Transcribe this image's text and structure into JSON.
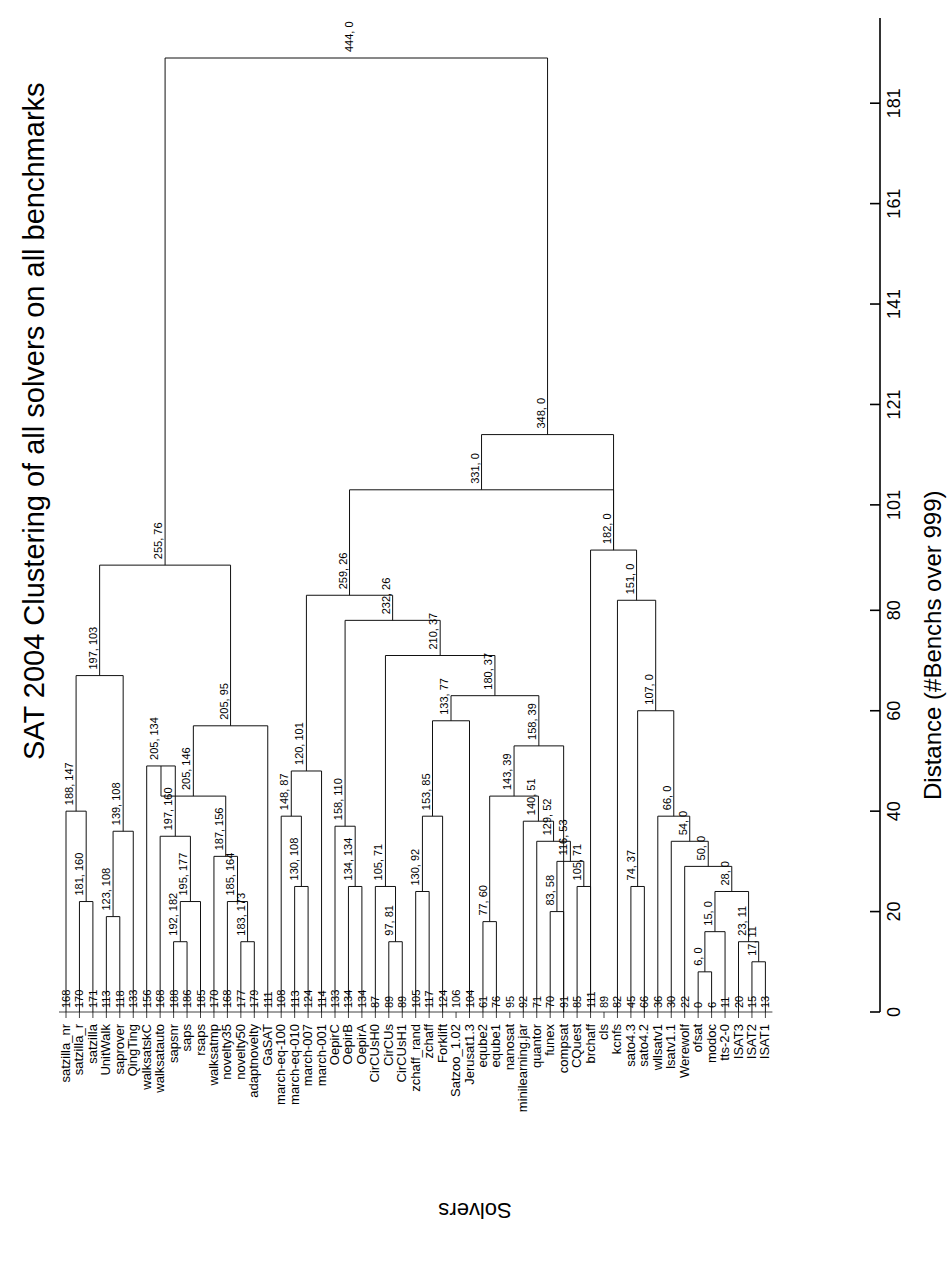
{
  "figure": {
    "title": "SAT 2004 Clustering of all solvers on all benchmarks",
    "y_axis_label": "Solvers",
    "x_axis_label": "Distance (#Benchs over 999)",
    "caption": "Fig. 5. Clusters of all solvers on all benchmarks",
    "orientation": "rotated-90",
    "line_color": "#000000",
    "background_color": "#ffffff"
  },
  "chart_data": {
    "type": "dendrogram",
    "title": "SAT 2004 Clustering of all solvers on all benchmarks",
    "xlabel": "Distance (#Benchs over 999)",
    "ylabel": "Solvers",
    "xlim": [
      0,
      190
    ],
    "grid": false,
    "axis_ticks": [
      0,
      20,
      40,
      60,
      80,
      101,
      121,
      141,
      161,
      181
    ],
    "leaf_count": 56,
    "leaves": [
      {
        "label": "satzilla_nr",
        "value": "168"
      },
      {
        "label": "satzilla_r",
        "value": "170"
      },
      {
        "label": "satzilla",
        "value": "171"
      },
      {
        "label": "UnitWalk",
        "value": "113"
      },
      {
        "label": "saprover",
        "value": "118"
      },
      {
        "label": "QingTing",
        "value": "133"
      },
      {
        "label": "walksatskC",
        "value": "156"
      },
      {
        "label": "walksatauto",
        "value": "168"
      },
      {
        "label": "sapsnr",
        "value": "188"
      },
      {
        "label": "saps",
        "value": "186"
      },
      {
        "label": "rsaps",
        "value": "185"
      },
      {
        "label": "walksatmp",
        "value": "170"
      },
      {
        "label": "novelty35",
        "value": "168"
      },
      {
        "label": "novelty50",
        "value": "177"
      },
      {
        "label": "adaptnovelty",
        "value": "179"
      },
      {
        "label": "GaSAT",
        "value": "111"
      },
      {
        "label": "march-eq-100",
        "value": "108"
      },
      {
        "label": "march-eq-010",
        "value": "113"
      },
      {
        "label": "march-007",
        "value": "124"
      },
      {
        "label": "march-001",
        "value": "114"
      },
      {
        "label": "OepirC",
        "value": "133"
      },
      {
        "label": "OepirB",
        "value": "134"
      },
      {
        "label": "OepirA",
        "value": "134"
      },
      {
        "label": "CirCUsH0",
        "value": "87"
      },
      {
        "label": "CirCUs",
        "value": "89"
      },
      {
        "label": "CirCUsH1",
        "value": "89"
      },
      {
        "label": "zchaff_rand",
        "value": "105"
      },
      {
        "label": "zchaff",
        "value": "117"
      },
      {
        "label": "Forklift",
        "value": "124"
      },
      {
        "label": "Satzoo_1.02",
        "value": "106"
      },
      {
        "label": "Jerusat1.3",
        "value": "104"
      },
      {
        "label": "eqube2",
        "value": "61"
      },
      {
        "label": "eqube1",
        "value": "76"
      },
      {
        "label": "nanosat",
        "value": "95"
      },
      {
        "label": "minilearning.jar",
        "value": "92"
      },
      {
        "label": "quantor",
        "value": "71"
      },
      {
        "label": "funex",
        "value": "70"
      },
      {
        "label": "compsat",
        "value": "91"
      },
      {
        "label": "CQuest",
        "value": "85"
      },
      {
        "label": "brchaff",
        "value": "111"
      },
      {
        "label": "cls",
        "value": "89"
      },
      {
        "label": "kcnfs",
        "value": "82"
      },
      {
        "label": "sato4.3",
        "value": "45"
      },
      {
        "label": "sato4.2",
        "value": "66"
      },
      {
        "label": "wllsatv1",
        "value": "36"
      },
      {
        "label": "lsatv1.1",
        "value": "30"
      },
      {
        "label": "Werewolf",
        "value": "22"
      },
      {
        "label": "ofsat",
        "value": "0"
      },
      {
        "label": "modoc",
        "value": "6"
      },
      {
        "label": "tts-2-0",
        "value": "11"
      },
      {
        "label": "ISAT3",
        "value": "20"
      },
      {
        "label": "ISAT2",
        "value": "15"
      },
      {
        "label": "ISAT1",
        "value": "13"
      }
    ],
    "merge_labels": [
      "444, 0",
      "348, 0",
      "331, 0",
      "255, 76",
      "259, 26",
      "232, 26",
      "197, 103",
      "205, 95",
      "188, 147",
      "181, 160",
      "123, 108",
      "139, 108",
      "205, 134",
      "197, 160",
      "205, 146",
      "192, 182",
      "195, 177",
      "187, 156",
      "185, 164",
      "183, 173",
      "120, 101",
      "148, 87",
      "130, 108",
      "172, 94",
      "158, 110",
      "105, 71",
      "97, 81",
      "153, 85",
      "130, 92",
      "210, 37",
      "133, 77",
      "180, 37",
      "158, 39",
      "143, 39",
      "140, 51",
      "129, 52",
      "116, 53",
      "105, 71",
      "83, 58",
      "77, 60",
      "182, 0",
      "151, 0",
      "74, 37",
      "107, 0",
      "66, 0",
      "54, 0",
      "50, 0",
      "28, 0",
      "15, 0",
      "6, 0",
      "23, 11",
      "17, 11"
    ]
  }
}
